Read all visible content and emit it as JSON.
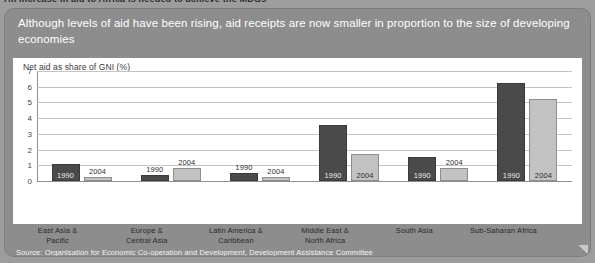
{
  "clipped_heading_above": "An increase in aid to Africa is needed to achieve the MDGs",
  "card": {
    "title": "Although levels of aid have been rising, aid receipts are now smaller in proportion to the size of developing economies",
    "source": "Source: Organisation for Economic Co-operation and Development, Development Assistance Committee"
  },
  "colors": {
    "header_band": "#8d8d8d",
    "plot_background": "#ffffff",
    "bar_1990": "#4a4a4a",
    "bar_2004": "#c2c2c2",
    "gridline": "#c3c3c3"
  },
  "chart_data": {
    "type": "bar",
    "title": "Net aid as share of GNI (%)",
    "xlabel": "",
    "ylabel": "Net aid as share of GNI (%)",
    "ylim": [
      0,
      7
    ],
    "yticks": [
      0,
      1,
      2,
      3,
      4,
      5,
      6,
      7
    ],
    "ytick_labels": [
      "0",
      "1",
      "2",
      "3",
      "4",
      "5",
      "6",
      "7"
    ],
    "grid": true,
    "legend": "none",
    "bar_labels_inline": true,
    "categories": [
      "East Asia & Pacific",
      "Europe & Central Asia",
      "Latin America & Caribbean",
      "Middle East & North Africa",
      "South Asia",
      "Sub-Saharan Africa"
    ],
    "category_lines": [
      [
        "East Asia &",
        "Pacific"
      ],
      [
        "Europe &",
        "Central Asia"
      ],
      [
        "Latin America &",
        "Caribbean"
      ],
      [
        "Middle East &",
        "North Africa"
      ],
      [
        "South Asia",
        ""
      ],
      [
        "Sub-Saharan Africa",
        ""
      ]
    ],
    "series": [
      {
        "name": "1990",
        "values": [
          1.1,
          0.4,
          0.5,
          3.55,
          1.5,
          6.25
        ]
      },
      {
        "name": "2004",
        "values": [
          0.25,
          0.8,
          0.25,
          1.7,
          0.8,
          5.2
        ]
      }
    ]
  }
}
